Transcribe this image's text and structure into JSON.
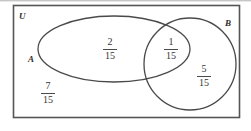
{
  "diagram": {
    "type": "venn",
    "title": "",
    "universe_label": "U",
    "set_labels": {
      "a": "A",
      "b": "B"
    },
    "regions": [
      {
        "name": "a-only",
        "numerator": "2",
        "denominator": "15",
        "value": "2/15"
      },
      {
        "name": "a-intersect-b",
        "numerator": "1",
        "denominator": "15",
        "value": "1/15"
      },
      {
        "name": "b-only",
        "numerator": "5",
        "denominator": "15",
        "value": "5/15"
      },
      {
        "name": "outside-both",
        "numerator": "7",
        "denominator": "15",
        "value": "7/15"
      }
    ],
    "colors": {
      "stroke": "#4a4a4a",
      "frame": "#555555",
      "text": "#333333",
      "background": "#ffffff"
    }
  }
}
